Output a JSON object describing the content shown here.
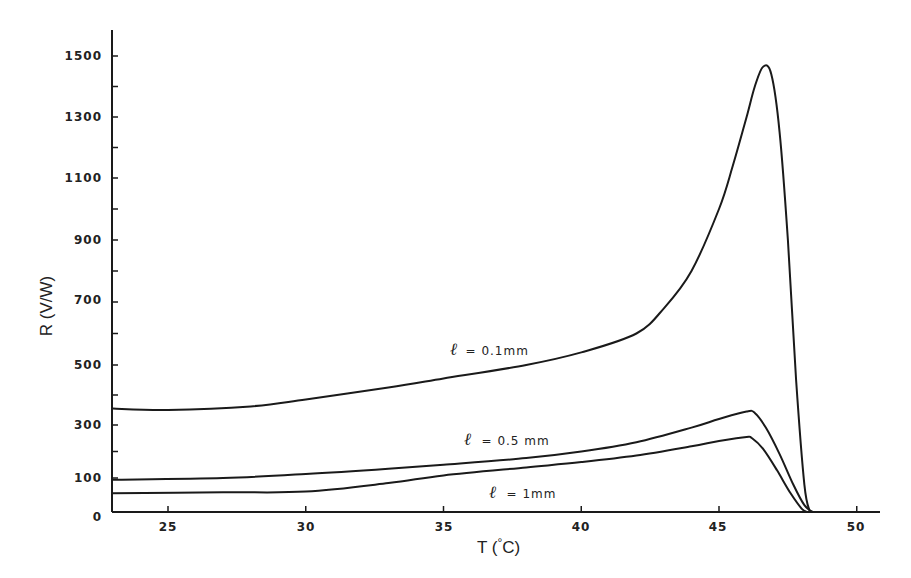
{
  "chart_data": {
    "type": "line",
    "title": "",
    "xlabel": "T (°C)",
    "ylabel": "R (V/W)",
    "xlim": [
      23,
      51
    ],
    "ylim": [
      0,
      1580
    ],
    "x_ticks": [
      25,
      30,
      35,
      40,
      45,
      50
    ],
    "y_ticks": [
      0,
      100,
      300,
      500,
      700,
      900,
      1100,
      1300,
      1500
    ],
    "y_minor_ticks": [
      200,
      400,
      600,
      800,
      1000,
      1200,
      1400
    ],
    "grid": false,
    "legend": "inline annotations",
    "series": [
      {
        "name": "ℓ = 0.1mm",
        "x": [
          23,
          25,
          28,
          30,
          33,
          35,
          38,
          40,
          42,
          43,
          44,
          45,
          45.5,
          46,
          46.3,
          46.6,
          46.9,
          47.2,
          47.5,
          47.8,
          48.1,
          48.3
        ],
        "y": [
          355,
          350,
          362,
          385,
          425,
          455,
          500,
          540,
          600,
          680,
          800,
          1000,
          1140,
          1300,
          1400,
          1465,
          1440,
          1250,
          900,
          450,
          80,
          0
        ]
      },
      {
        "name": "ℓ = 0.5 mm",
        "x": [
          23,
          27,
          30,
          33,
          35,
          38,
          40,
          42,
          44,
          45,
          46,
          46.3,
          46.7,
          47.2,
          47.7,
          48.1,
          48.4
        ],
        "y": [
          95,
          100,
          115,
          135,
          150,
          175,
          200,
          235,
          290,
          320,
          345,
          340,
          290,
          190,
          80,
          20,
          0
        ]
      },
      {
        "name": "ℓ = 1mm",
        "x": [
          23,
          27,
          30,
          33,
          35,
          38,
          40,
          42,
          44,
          45,
          46,
          46.2,
          46.6,
          47.1,
          47.6,
          48.0,
          48.2
        ],
        "y": [
          55,
          58,
          60,
          85,
          110,
          140,
          160,
          185,
          220,
          240,
          255,
          250,
          210,
          130,
          55,
          10,
          0
        ]
      }
    ]
  },
  "axes": {
    "x_title_main": "T (",
    "x_title_deg": "°",
    "x_title_unit": "C)",
    "y_title": "R (V/W)",
    "x_tick_labels": [
      "25",
      "30",
      "35",
      "40",
      "45",
      "50"
    ],
    "y_tick_labels": [
      "0",
      "100",
      "300",
      "500",
      "700",
      "900",
      "1100",
      "1300",
      "1500"
    ]
  },
  "annotations": {
    "a1_ell": "ℓ",
    "a1_text": "= 0.1mm",
    "a2_ell": "ℓ",
    "a2_text": "= 0.5 mm",
    "a3_ell": "ℓ",
    "a3_text": "= 1mm"
  }
}
